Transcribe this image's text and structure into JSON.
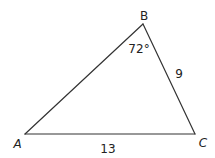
{
  "diagram": {
    "type": "triangle",
    "stroke_color": "#333333",
    "text_color": "#222222",
    "background": "#ffffff",
    "vertices": {
      "A": {
        "label": "A",
        "x": 25,
        "y": 134
      },
      "B": {
        "label": "B",
        "x": 143,
        "y": 24
      },
      "C": {
        "label": "C",
        "x": 195,
        "y": 134
      }
    },
    "sides": {
      "AC": {
        "label": "13"
      },
      "BC": {
        "label": "9"
      },
      "AB": {
        "label": ""
      }
    },
    "angles": {
      "B": {
        "label": "72°"
      }
    }
  }
}
